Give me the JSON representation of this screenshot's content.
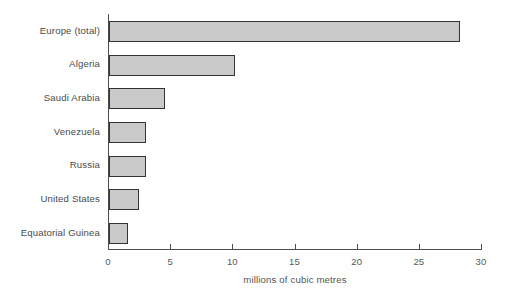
{
  "chart_data": {
    "type": "bar",
    "orientation": "horizontal",
    "title": "",
    "subtitle": "",
    "xlabel": "millions of cubic metres",
    "ylabel": "",
    "categories": [
      "Europe (total)",
      "Algeria",
      "Saudi Arabia",
      "Venezuela",
      "Russia",
      "United States",
      "Equatorial Guinea"
    ],
    "values": [
      28.2,
      10.1,
      4.5,
      3.0,
      3.0,
      2.4,
      1.5
    ],
    "xlim": [
      0,
      30
    ],
    "xticks": [
      0,
      5,
      10,
      15,
      20,
      25,
      30
    ],
    "xtick_labels": [
      "0",
      "5",
      "10",
      "15",
      "20",
      "25",
      "30"
    ],
    "grid": false,
    "legend": null,
    "annotations": [],
    "colors": {
      "bar_fill": "#c9c9c9",
      "bar_border": "#333333",
      "axis": "#4d4d4d",
      "text": "#4a4a4a",
      "background": "#ffffff"
    }
  }
}
